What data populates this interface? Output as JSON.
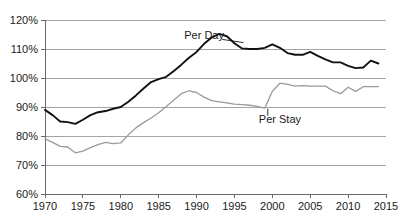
{
  "chart_data": {
    "type": "line",
    "title": "",
    "subtitle": "",
    "xlabel": "",
    "ylabel": "",
    "xlim": [
      1970,
      2015
    ],
    "ylim": [
      60,
      120
    ],
    "y_tick_labels": [
      "60%",
      "70%",
      "80%",
      "90%",
      "100%",
      "110%",
      "120%"
    ],
    "y_tick_values": [
      60,
      70,
      80,
      90,
      100,
      110,
      120
    ],
    "x_tick_labels": [
      "1970",
      "1975",
      "1980",
      "1985",
      "1990",
      "1995",
      "2000",
      "2005",
      "2010",
      "2015"
    ],
    "x_tick_values": [
      1970,
      1975,
      1980,
      1985,
      1990,
      1995,
      2000,
      2005,
      2010,
      2015
    ],
    "grid": true,
    "legend_position": "inline-annotations",
    "value_unit": "percent",
    "series": [
      {
        "name": "Per Day",
        "color": "#111111",
        "stroke_width": 1.9,
        "label_x": 1991,
        "label_y": 113.5,
        "x": [
          1970,
          1971,
          1972,
          1973,
          1974,
          1975,
          1976,
          1977,
          1978,
          1979,
          1980,
          1981,
          1982,
          1983,
          1984,
          1985,
          1986,
          1987,
          1988,
          1989,
          1990,
          1991,
          1992,
          1993,
          1994,
          1995,
          1996,
          1997,
          1998,
          1999,
          2000,
          2001,
          2002,
          2003,
          2004,
          2005,
          2006,
          2007,
          2008,
          2009,
          2010,
          2011,
          2012,
          2013,
          2014
        ],
        "values": [
          89.0,
          87.2,
          85.0,
          84.8,
          84.2,
          85.6,
          87.2,
          88.2,
          88.6,
          89.4,
          90.0,
          91.8,
          94.0,
          96.4,
          98.6,
          99.6,
          100.4,
          102.4,
          104.6,
          107.0,
          109.0,
          111.8,
          114.0,
          115.2,
          114.4,
          112.0,
          110.2,
          110.0,
          110.0,
          110.4,
          111.6,
          110.4,
          108.6,
          108.0,
          108.0,
          109.0,
          107.6,
          106.4,
          105.4,
          105.4,
          104.2,
          103.4,
          103.6,
          106.0,
          105.0
        ]
      },
      {
        "name": "Per Stay",
        "color": "#9a9a9a",
        "stroke_width": 1.3,
        "label_x": 2001,
        "label_y": 84.5,
        "x": [
          1970,
          1971,
          1972,
          1973,
          1974,
          1975,
          1976,
          1977,
          1978,
          1979,
          1980,
          1981,
          1982,
          1983,
          1984,
          1985,
          1986,
          1987,
          1988,
          1989,
          1990,
          1991,
          1992,
          1993,
          1994,
          1995,
          1996,
          1997,
          1998,
          1999,
          2000,
          2001,
          2002,
          2003,
          2004,
          2005,
          2006,
          2007,
          2008,
          2009,
          2010,
          2011,
          2012,
          2013,
          2014
        ],
        "values": [
          79.0,
          77.8,
          76.4,
          76.2,
          74.2,
          74.8,
          76.0,
          77.0,
          77.8,
          77.4,
          77.6,
          80.4,
          82.8,
          84.6,
          86.2,
          88.0,
          90.2,
          92.4,
          94.6,
          95.6,
          95.0,
          93.4,
          92.2,
          91.8,
          91.4,
          91.0,
          90.8,
          90.6,
          90.2,
          89.6,
          95.4,
          98.2,
          97.8,
          97.2,
          97.4,
          97.2,
          97.2,
          97.2,
          95.6,
          94.6,
          96.8,
          95.4,
          97.0,
          97.0,
          97.0
        ]
      }
    ]
  }
}
